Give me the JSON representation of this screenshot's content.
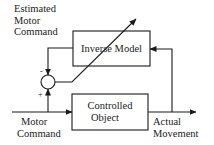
{
  "diagram": {
    "type": "block-diagram",
    "colors": {
      "line": "#1a1a1a",
      "background": "#ffffff"
    },
    "blocks": [
      {
        "id": "inverse-model",
        "label": "Inverse Model",
        "adaptive": true
      },
      {
        "id": "controlled-object",
        "label_line1": "Controlled",
        "label_line2": "Object"
      }
    ],
    "summing_junction": {
      "minus_sign": "-",
      "plus_sign": "+"
    },
    "labels": {
      "estimated_line1": "Estimated",
      "estimated_line2": "Motor",
      "estimated_line3": "Command",
      "motor_line1": "Motor",
      "motor_line2": "Command",
      "actual_line1": "Actual",
      "actual_line2": "Movement"
    },
    "blocks_text": {
      "inverse_model": "Inverse Model",
      "controlled_line1": "Controlled",
      "controlled_line2": "Object"
    },
    "connections": [
      {
        "from": "motor-command",
        "to": "controlled-object"
      },
      {
        "from": "motor-command",
        "to": "summing-junction",
        "sign": "+"
      },
      {
        "from": "inverse-model",
        "to": "summing-junction",
        "sign": "-"
      },
      {
        "from": "controlled-object",
        "to": "actual-movement"
      },
      {
        "from": "actual-movement",
        "to": "inverse-model",
        "type": "feedback"
      },
      {
        "from": "summing-junction",
        "to": "inverse-model",
        "type": "error-adjusts-model"
      }
    ]
  }
}
